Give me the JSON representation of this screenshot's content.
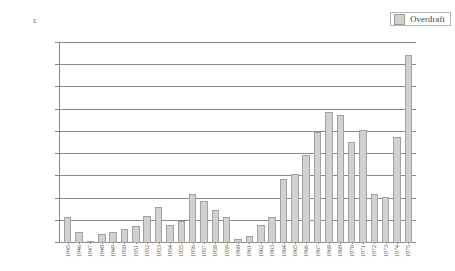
{
  "chart_data": {
    "type": "bar",
    "title": "",
    "xlabel": "",
    "ylabel": "£",
    "ylim": [
      0,
      18000000
    ],
    "ytick_labels": [
      "18000000",
      "16000000",
      "14000000",
      "12000000",
      "10000000",
      "8000000",
      "6000000",
      "4000000",
      "2000000",
      "0"
    ],
    "ytick_values": [
      18000000,
      16000000,
      14000000,
      12000000,
      10000000,
      8000000,
      6000000,
      4000000,
      2000000,
      0
    ],
    "grid": true,
    "legend_position": "top-right",
    "legend": [
      "Overdraft"
    ],
    "series": [
      {
        "name": "Overdraft",
        "color": "#d3d1cf",
        "border_color": "#a3a09d",
        "values": [
          2300000,
          1000000,
          200000,
          850000,
          1000000,
          1250000,
          1500000,
          2400000,
          3250000,
          1600000,
          2000000,
          4400000,
          3800000,
          3000000,
          2300000,
          350000,
          650000,
          1600000,
          2300000,
          5750000,
          6250000,
          7950000,
          9950000,
          11800000,
          11550000,
          9050000,
          10200000,
          4400000,
          4100000,
          9500000,
          16900000
        ]
      }
    ],
    "categories": [
      "1945",
      "1946",
      "1947",
      "1948",
      "1949",
      "1950",
      "1951",
      "1952",
      "1953",
      "1954",
      "1955",
      "1956",
      "1957",
      "1958",
      "1959",
      "1960",
      "1961",
      "1962",
      "1963",
      "1964",
      "1965",
      "1966",
      "1967",
      "1968",
      "1969",
      "1970",
      "1971",
      "1972",
      "1973",
      "1974",
      "1975"
    ]
  }
}
